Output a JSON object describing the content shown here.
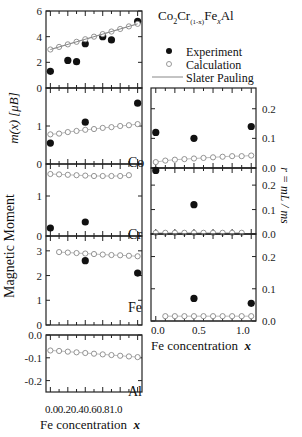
{
  "compound": {
    "base": "Co",
    "s1": "2",
    "mid": "Cr",
    "s2": "(1-x)",
    "mid2": "Fe",
    "s3": "x",
    "end": "Al"
  },
  "legend": {
    "experiment": "Experiment",
    "calculation": "Calculation",
    "slater": "Slater Pauling"
  },
  "left_ylabel_main": "Magnetic Moment",
  "left_ylabel_unit": "m(x) [μB]",
  "right_ylabel": "r = mL / ms",
  "left_xlabel": "Fe concentration",
  "right_xlabel": "Fe concentration",
  "xvar": "x",
  "element_labels": {
    "co": "Co",
    "cr": "Cr",
    "fe": "Fe",
    "al": "Al"
  },
  "left_xticks": [
    "0.0",
    "0.2",
    "0.4",
    "0.6",
    "0.8",
    "1.0"
  ],
  "right_xticks": [
    "0.0",
    "0.5",
    "1.0"
  ],
  "chart_data": [
    {
      "type": "scatter",
      "title": "Total",
      "ylabel": "m(x) [μB]",
      "ylim": [
        0,
        6
      ],
      "yticks": [
        0,
        2,
        4,
        6
      ],
      "series": [
        {
          "name": "Experiment",
          "x": [
            0.0,
            0.2,
            0.3,
            0.4,
            0.6,
            0.7,
            1.0
          ],
          "y": [
            1.3,
            2.15,
            2.05,
            3.45,
            4.0,
            3.75,
            5.2
          ]
        },
        {
          "name": "Calculation",
          "x": [
            0.0,
            0.1,
            0.2,
            0.3,
            0.4,
            0.5,
            0.6,
            0.7,
            0.8,
            0.9,
            1.0
          ],
          "y": [
            3.0,
            3.2,
            3.4,
            3.6,
            3.8,
            4.0,
            4.2,
            4.4,
            4.6,
            4.8,
            5.0
          ]
        },
        {
          "name": "Slater Pauling",
          "x": [
            0,
            1
          ],
          "y": [
            3,
            5
          ]
        }
      ]
    },
    {
      "type": "scatter",
      "title": "Co",
      "ylim": [
        0,
        2
      ],
      "yticks": [
        0,
        1
      ],
      "series": [
        {
          "name": "Experiment",
          "x": [
            0.0,
            0.4,
            1.0
          ],
          "y": [
            0.55,
            1.1,
            1.6
          ]
        },
        {
          "name": "Calculation",
          "x": [
            0.0,
            0.1,
            0.2,
            0.3,
            0.4,
            0.5,
            0.6,
            0.7,
            0.8,
            0.9,
            1.0
          ],
          "y": [
            0.78,
            0.8,
            0.84,
            0.87,
            0.9,
            0.92,
            0.95,
            0.97,
            1.0,
            1.02,
            1.05
          ]
        }
      ]
    },
    {
      "type": "scatter",
      "title": "Cr",
      "ylim": [
        0,
        1.8
      ],
      "yticks": [
        0,
        1
      ],
      "series": [
        {
          "name": "Experiment",
          "x": [
            0.0,
            0.4
          ],
          "y": [
            0.2,
            0.35
          ]
        },
        {
          "name": "Calculation",
          "x": [
            0.0,
            0.1,
            0.2,
            0.3,
            0.4,
            0.5,
            0.6,
            0.7,
            0.8,
            0.9
          ],
          "y": [
            1.55,
            1.54,
            1.53,
            1.52,
            1.51,
            1.5,
            1.5,
            1.5,
            1.5,
            1.52
          ]
        }
      ]
    },
    {
      "type": "scatter",
      "title": "Fe",
      "ylim": [
        0,
        3.6
      ],
      "yticks": [
        0,
        1,
        2,
        3
      ],
      "series": [
        {
          "name": "Experiment",
          "x": [
            0.4,
            1.0
          ],
          "y": [
            2.6,
            2.1
          ]
        },
        {
          "name": "Calculation",
          "x": [
            0.1,
            0.2,
            0.3,
            0.4,
            0.5,
            0.6,
            0.7,
            0.8,
            0.9,
            1.0
          ],
          "y": [
            2.95,
            2.93,
            2.91,
            2.89,
            2.87,
            2.85,
            2.83,
            2.82,
            2.8,
            2.78
          ]
        }
      ]
    },
    {
      "type": "scatter",
      "title": "Al",
      "ylim": [
        -0.25,
        0
      ],
      "yticks": [
        0.0,
        -0.1,
        -0.2
      ],
      "series": [
        {
          "name": "Calculation",
          "x": [
            0.0,
            0.1,
            0.2,
            0.3,
            0.4,
            0.5,
            0.6,
            0.7,
            0.8,
            0.9,
            1.0
          ],
          "y": [
            -0.068,
            -0.07,
            -0.073,
            -0.076,
            -0.079,
            -0.082,
            -0.085,
            -0.088,
            -0.091,
            -0.094,
            -0.097
          ]
        }
      ]
    },
    {
      "type": "scatter",
      "title": "r Co",
      "ylabel": "r = mL/ms",
      "ylim": [
        0,
        0.27
      ],
      "yticks": [
        0.0,
        0.1,
        0.2
      ],
      "series": [
        {
          "name": "Experiment",
          "x": [
            0.0,
            0.4,
            1.0
          ],
          "y": [
            0.12,
            0.1,
            0.14
          ]
        },
        {
          "name": "Calculation",
          "x": [
            0.0,
            0.1,
            0.2,
            0.3,
            0.4,
            0.5,
            0.6,
            0.7,
            0.8,
            0.9,
            1.0
          ],
          "y": [
            0.02,
            0.025,
            0.028,
            0.03,
            0.032,
            0.034,
            0.036,
            0.038,
            0.04,
            0.04,
            0.042
          ]
        }
      ]
    },
    {
      "type": "scatter",
      "title": "r Cr",
      "ylim": [
        0,
        0.27
      ],
      "yticks": [
        0.0,
        0.1,
        0.2
      ],
      "series": [
        {
          "name": "Experiment",
          "x": [
            0.0,
            0.4
          ],
          "y": [
            0.26,
            0.12
          ]
        },
        {
          "name": "Calculation",
          "x": [
            0.0,
            0.1,
            0.2,
            0.3,
            0.4,
            0.5,
            0.6,
            0.7,
            0.8,
            0.9
          ],
          "y": [
            0.005,
            0.005,
            0.005,
            0.005,
            0.005,
            0.005,
            0.005,
            0.005,
            0.005,
            0.005
          ]
        }
      ]
    },
    {
      "type": "scatter",
      "title": "r Fe",
      "ylim": [
        0,
        0.27
      ],
      "yticks": [
        0.0,
        0.1,
        0.2
      ],
      "series": [
        {
          "name": "Experiment",
          "x": [
            0.4,
            1.0
          ],
          "y": [
            0.07,
            0.055
          ]
        },
        {
          "name": "Calculation",
          "x": [
            0.1,
            0.2,
            0.3,
            0.4,
            0.5,
            0.6,
            0.7,
            0.8,
            0.9,
            1.0
          ],
          "y": [
            0.015,
            0.015,
            0.015,
            0.015,
            0.015,
            0.015,
            0.015,
            0.015,
            0.015,
            0.015
          ]
        }
      ]
    }
  ]
}
